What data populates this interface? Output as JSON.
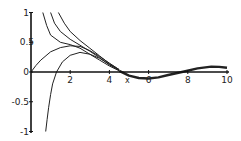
{
  "chart_data": {
    "type": "line",
    "title": "",
    "xlabel": "x",
    "ylabel": "",
    "xlim": [
      0,
      10
    ],
    "ylim": [
      -1,
      1
    ],
    "grid": false,
    "legend": null,
    "x_ticks": [
      {
        "value": 2,
        "label": "2"
      },
      {
        "value": 4,
        "label": "4"
      },
      {
        "value": 6,
        "label": "6"
      },
      {
        "value": 8,
        "label": "8"
      },
      {
        "value": 10,
        "label": "10"
      }
    ],
    "y_ticks": [
      {
        "value": 1,
        "label": "1"
      },
      {
        "value": 0.5,
        "label": "0.5"
      },
      {
        "value": 0,
        "label": "0"
      },
      {
        "value": -0.5,
        "label": "-0.5"
      },
      {
        "value": -1,
        "label": "-1"
      }
    ],
    "line_color": "#222222",
    "series": [
      {
        "name": "curve-1",
        "points": [
          [
            0.6,
            1
          ],
          [
            0.8,
            0.78
          ],
          [
            1,
            0.62
          ],
          [
            1.5,
            0.5
          ],
          [
            2,
            0.46
          ],
          [
            2.5,
            0.4
          ],
          [
            3,
            0.3
          ],
          [
            3.5,
            0.2
          ],
          [
            4,
            0.1
          ],
          [
            4.5,
            0.02
          ]
        ]
      },
      {
        "name": "curve-2",
        "points": [
          [
            1,
            1
          ],
          [
            1.2,
            0.82
          ],
          [
            1.5,
            0.68
          ],
          [
            2,
            0.55
          ],
          [
            2.5,
            0.45
          ],
          [
            3,
            0.35
          ],
          [
            3.5,
            0.24
          ],
          [
            4,
            0.12
          ],
          [
            4.5,
            0.03
          ]
        ]
      },
      {
        "name": "curve-3",
        "points": [
          [
            1.4,
            1
          ],
          [
            1.7,
            0.82
          ],
          [
            2,
            0.68
          ],
          [
            2.5,
            0.53
          ],
          [
            3,
            0.4
          ],
          [
            3.5,
            0.27
          ],
          [
            4,
            0.14
          ],
          [
            4.5,
            0.04
          ]
        ]
      },
      {
        "name": "curve-4",
        "points": [
          [
            0,
            0
          ],
          [
            0.25,
            0.11
          ],
          [
            0.5,
            0.2
          ],
          [
            1,
            0.34
          ],
          [
            1.5,
            0.41
          ],
          [
            2,
            0.44
          ],
          [
            2.5,
            0.43
          ],
          [
            3,
            0.36
          ],
          [
            3.5,
            0.26
          ],
          [
            4,
            0.15
          ],
          [
            4.5,
            0.04
          ]
        ]
      },
      {
        "name": "curve-5",
        "points": [
          [
            0.75,
            -1
          ],
          [
            0.82,
            -0.8
          ],
          [
            0.9,
            -0.6
          ],
          [
            1,
            -0.38
          ],
          [
            1.1,
            -0.2
          ],
          [
            1.3,
            0
          ],
          [
            1.6,
            0.17
          ],
          [
            2,
            0.28
          ],
          [
            2.5,
            0.33
          ],
          [
            3,
            0.3
          ],
          [
            3.5,
            0.23
          ],
          [
            4,
            0.13
          ],
          [
            4.5,
            0.03
          ]
        ]
      },
      {
        "name": "common-tail",
        "points": [
          [
            4.5,
            0.02
          ],
          [
            5,
            -0.06
          ],
          [
            5.5,
            -0.1
          ],
          [
            6,
            -0.11
          ],
          [
            6.5,
            -0.09
          ],
          [
            7,
            -0.05
          ],
          [
            7.7,
            0
          ],
          [
            8.5,
            0.06
          ],
          [
            9.2,
            0.09
          ],
          [
            9.6,
            0.085
          ],
          [
            10,
            0.07
          ]
        ]
      }
    ]
  }
}
